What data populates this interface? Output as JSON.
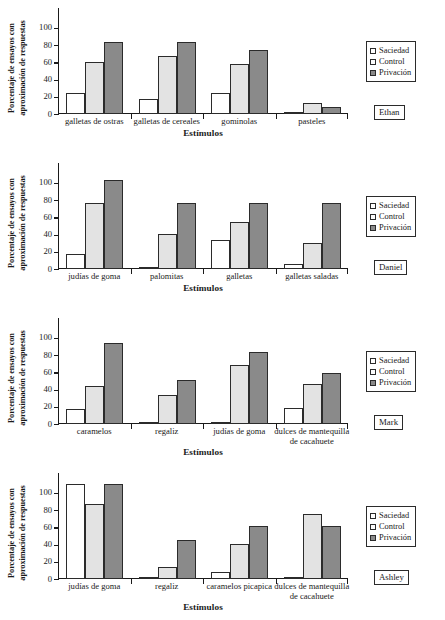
{
  "figure": {
    "axis": {
      "ylabel_line1": "Porcentaje de ensayos con",
      "ylabel_line2": "aproximación de respuestas",
      "xlabel": "Estímulos",
      "yticks": [
        "0",
        "20",
        "40",
        "60",
        "80",
        "100"
      ]
    },
    "legend": {
      "items": [
        {
          "label": "Saciedad",
          "color": "#ffffff"
        },
        {
          "label": "Control",
          "color": "#e3e3e3"
        },
        {
          "label": "Privación",
          "color": "#8a8a8a"
        }
      ]
    }
  },
  "chart_data": [
    {
      "type": "bar",
      "title": "Ethan",
      "subject": "Ethan",
      "xlabel": "Estímulos",
      "ylabel": "Porcentaje de ensayos con aproximación de respuestas",
      "ylim": [
        0,
        100
      ],
      "yticks": [
        0,
        20,
        40,
        60,
        80,
        100
      ],
      "grid": false,
      "legend_position": "right",
      "categories": [
        "galletas de ostras",
        "galletas de cereales",
        "gominolas",
        "pasteles"
      ],
      "series": [
        {
          "name": "Saciedad",
          "values": [
            24,
            17,
            24,
            1
          ]
        },
        {
          "name": "Control",
          "values": [
            60,
            67,
            58,
            13
          ]
        },
        {
          "name": "Privación",
          "values": [
            83,
            83,
            74,
            8
          ]
        }
      ]
    },
    {
      "type": "bar",
      "title": "Daniel",
      "subject": "Daniel",
      "xlabel": "Estímulos",
      "ylabel": "Porcentaje de ensayos con aproximación de respuestas",
      "ylim": [
        0,
        100
      ],
      "yticks": [
        0,
        20,
        40,
        60,
        80,
        100
      ],
      "grid": false,
      "legend_position": "right",
      "categories": [
        "judías de goma",
        "palomitas",
        "galletas",
        "galletas saladas"
      ],
      "series": [
        {
          "name": "Saciedad",
          "values": [
            17,
            1,
            34,
            6
          ]
        },
        {
          "name": "Control",
          "values": [
            77,
            41,
            55,
            30
          ]
        },
        {
          "name": "Privación",
          "values": [
            103,
            77,
            77,
            76
          ]
        }
      ]
    },
    {
      "type": "bar",
      "title": "Mark",
      "subject": "Mark",
      "xlabel": "Estímulos",
      "ylabel": "Porcentaje de ensayos con aproximación de respuestas",
      "ylim": [
        0,
        100
      ],
      "yticks": [
        0,
        20,
        40,
        60,
        80,
        100
      ],
      "grid": false,
      "legend_position": "right",
      "categories": [
        "caramelos",
        "regaliz",
        "judías de goma",
        "dulces de mantequilla de cacahuete"
      ],
      "series": [
        {
          "name": "Saciedad",
          "values": [
            17,
            1,
            1,
            18
          ]
        },
        {
          "name": "Control",
          "values": [
            44,
            34,
            68,
            46
          ]
        },
        {
          "name": "Privación",
          "values": [
            94,
            51,
            84,
            59
          ]
        }
      ]
    },
    {
      "type": "bar",
      "title": "Ashley",
      "subject": "Ashley",
      "xlabel": "Estímulos",
      "ylabel": "Porcentaje de ensayos con aproximación de respuestas",
      "ylim": [
        0,
        100
      ],
      "yticks": [
        0,
        20,
        40,
        60,
        80,
        100
      ],
      "grid": false,
      "legend_position": "right",
      "categories": [
        "judías de goma",
        "regaliz",
        "caramelos picapica",
        "dulces de mantequilla de cacahuete"
      ],
      "series": [
        {
          "name": "Saciedad",
          "values": [
            110,
            1,
            8,
            1
          ]
        },
        {
          "name": "Control",
          "values": [
            87,
            14,
            41,
            75
          ]
        },
        {
          "name": "Privación",
          "values": [
            110,
            45,
            62,
            62
          ]
        }
      ]
    }
  ],
  "panel_labels": {
    "p0": [
      "galletas de ostras",
      "galletas de cereales",
      "gominolas",
      "pasteles"
    ],
    "p1": [
      "judías de goma",
      "palomitas",
      "galletas",
      "galletas saladas"
    ],
    "p2": [
      "caramelos",
      "regaliz",
      "judías de goma",
      "dulces de mantequilla|de cacahuete"
    ],
    "p3": [
      "judías de goma",
      "regaliz",
      "caramelos picapica",
      "dulces de mantequilla|de cacahuete"
    ]
  }
}
